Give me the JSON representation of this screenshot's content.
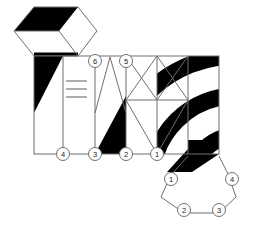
{
  "document": {
    "title": "Hexagonal plan and striped elevation diagram",
    "kind": "technical-line-drawing",
    "background_color": "#ffffff",
    "line_color": "#7a7a7a",
    "fill_color": "#000000",
    "label_text_color": "#1a1a1a"
  },
  "chart_data": {
    "type": "diagram",
    "xlabel": "",
    "ylabel": "",
    "grid": false,
    "legend": "none",
    "units": "pixels",
    "viewbox": [
      0,
      0,
      256,
      230
    ],
    "shapes": [
      {
        "id": "upper-hexagon",
        "kind": "hexagon",
        "points": "78,7 34,7 14,31 34,56 78,56 97,31",
        "note": "plan hexagon at top-left, bottom edge coincides with elevation top-left corner"
      },
      {
        "id": "upper-hexagon-black-band",
        "kind": "filled-parallelogram",
        "points": "34,7 78,7 59,31 14,31",
        "fill": "#000000"
      },
      {
        "id": "upper-hexagon-bottom-black-sliver",
        "kind": "filled-parallelogram",
        "points": "34,53 78,53 78,56 34,56",
        "fill": "#000000"
      },
      {
        "id": "elevation-rect",
        "kind": "rectangle",
        "x": 34,
        "y": 56,
        "w": 185,
        "h": 98
      },
      {
        "id": "bay-divider-4",
        "kind": "vline",
        "x": 63,
        "y1": 56,
        "y2": 154
      },
      {
        "id": "bay-divider-3",
        "kind": "vline",
        "x": 95,
        "y1": 56,
        "y2": 154
      },
      {
        "id": "bay-divider-2",
        "kind": "vline",
        "x": 126,
        "y1": 56,
        "y2": 154
      },
      {
        "id": "bay-divider-1",
        "kind": "vline",
        "x": 157,
        "y1": 56,
        "y2": 154
      },
      {
        "id": "bay-divider-right",
        "kind": "vline",
        "x": 188,
        "y1": 56,
        "y2": 154
      },
      {
        "id": "left-bay-black-triangle",
        "kind": "filled-triangle",
        "points": "34,56 63,56 34,113",
        "fill": "#000000"
      },
      {
        "id": "hatch-line-1",
        "kind": "hline",
        "x1": 66,
        "y1": 81,
        "x2": 86,
        "y2": 81
      },
      {
        "id": "hatch-line-2",
        "kind": "hline",
        "x1": 66,
        "y1": 89,
        "x2": 86,
        "y2": 89
      },
      {
        "id": "hatch-line-3",
        "kind": "hline",
        "x1": 66,
        "y1": 97,
        "x2": 86,
        "y2": 97
      },
      {
        "id": "zigzag-v",
        "kind": "polyline",
        "points": "95,111 110,57 126,111",
        "note": "V shape apex at top between markers 6 and 5"
      },
      {
        "id": "bay3-black-triangle",
        "kind": "filled-triangle",
        "points": "126,96 126,154 95,154",
        "fill": "#000000"
      },
      {
        "id": "diamond",
        "kind": "polygon",
        "points": "157,56 188,100 157,154 126,100",
        "note": "central diamond in bay between markers 2 and 1"
      },
      {
        "id": "diagonal-top-left",
        "kind": "line",
        "x1": 126,
        "y1": 56,
        "x2": 157,
        "y2": 100
      },
      {
        "id": "diagonal-top-right",
        "kind": "line",
        "x1": 188,
        "y1": 56,
        "x2": 157,
        "y2": 100
      },
      {
        "id": "arc-stripe-1",
        "kind": "filled-arc-band",
        "fill": "#000000",
        "note": "outer concentric black band in right bay"
      },
      {
        "id": "arc-stripe-2",
        "kind": "filled-arc-band",
        "fill": "#000000",
        "note": "middle concentric black band in right bay"
      },
      {
        "id": "arc-stripe-3",
        "kind": "filled-arc-band",
        "fill": "#000000",
        "note": "inner concentric black band in right bay"
      },
      {
        "id": "lower-hexagon",
        "kind": "hexagon",
        "points": "175,170 228,170 243,197 228,221 175,221 161,197",
        "note": "plan hexagon at bottom-right"
      },
      {
        "id": "lower-hexagon-black-band",
        "kind": "filled-parallelogram",
        "points": "188,140 219,140 190,170 169,170",
        "fill": "#000000",
        "note": "black band descending from elevation into lower hexagon"
      }
    ],
    "markers": [
      {
        "label": "6",
        "x": 95,
        "y": 61,
        "group": "elevation-top"
      },
      {
        "label": "5",
        "x": 126,
        "y": 61,
        "group": "elevation-top"
      },
      {
        "label": "4",
        "x": 63,
        "y": 154,
        "group": "elevation-bottom"
      },
      {
        "label": "3",
        "x": 95,
        "y": 154,
        "group": "elevation-bottom"
      },
      {
        "label": "2",
        "x": 126,
        "y": 154,
        "group": "elevation-bottom"
      },
      {
        "label": "1",
        "x": 157,
        "y": 154,
        "group": "elevation-bottom"
      },
      {
        "label": "1",
        "x": 171,
        "y": 179,
        "group": "lower-hexagon"
      },
      {
        "label": "4",
        "x": 232,
        "y": 179,
        "group": "lower-hexagon"
      },
      {
        "label": "2",
        "x": 184,
        "y": 210,
        "group": "lower-hexagon"
      },
      {
        "label": "3",
        "x": 219,
        "y": 210,
        "group": "lower-hexagon"
      }
    ],
    "marker_labels": [
      "1",
      "2",
      "3",
      "4",
      "5",
      "6"
    ],
    "marker_radius": 6.5
  }
}
